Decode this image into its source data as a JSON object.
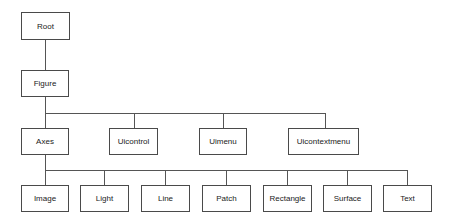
{
  "diagram": {
    "type": "hierarchy-tree",
    "colors": {
      "line": "#555555",
      "border": "#4a4a4a",
      "text": "#222222",
      "background": "#ffffff"
    },
    "root": {
      "label": "Root"
    },
    "level1": {
      "label": "Figure"
    },
    "level2": [
      {
        "label": "Axes"
      },
      {
        "label": "Uicontrol"
      },
      {
        "label": "Uimenu"
      },
      {
        "label": "Uicontextmenu"
      }
    ],
    "level3": [
      {
        "label": "Image"
      },
      {
        "label": "Light"
      },
      {
        "label": "Line"
      },
      {
        "label": "Patch"
      },
      {
        "label": "Rectangle"
      },
      {
        "label": "Surface"
      },
      {
        "label": "Text"
      }
    ],
    "edges": [
      [
        "Root",
        "Figure"
      ],
      [
        "Figure",
        "Axes"
      ],
      [
        "Figure",
        "Uicontrol"
      ],
      [
        "Figure",
        "Uimenu"
      ],
      [
        "Figure",
        "Uicontextmenu"
      ],
      [
        "Axes",
        "Image"
      ],
      [
        "Axes",
        "Light"
      ],
      [
        "Axes",
        "Line"
      ],
      [
        "Axes",
        "Patch"
      ],
      [
        "Axes",
        "Rectangle"
      ],
      [
        "Axes",
        "Surface"
      ],
      [
        "Axes",
        "Text"
      ]
    ]
  }
}
